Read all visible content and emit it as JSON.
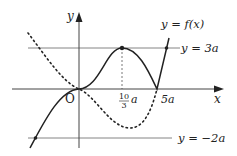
{
  "diagram": {
    "type": "function-graph",
    "axes": {
      "x_label": "x",
      "y_label": "y",
      "origin_label": "O"
    },
    "curves": [
      {
        "name": "f",
        "label": "y = f(x)",
        "style": "solid"
      },
      {
        "name": "reflection",
        "style": "dotted"
      }
    ],
    "horizontal_lines": [
      {
        "label": "y = 3a",
        "value": "3a"
      },
      {
        "label": "y = −2a",
        "value": "-2a"
      }
    ],
    "x_ticks": [
      {
        "numerator": "10",
        "denominator": "3",
        "suffix": "a"
      },
      {
        "label": "5a"
      }
    ],
    "colors": {
      "curve": "#222222",
      "axis": "#555555",
      "guide": "#777777"
    }
  }
}
